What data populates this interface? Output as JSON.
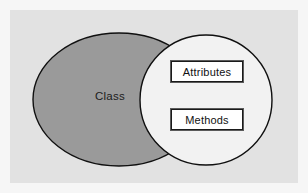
{
  "diagram": {
    "canvas": {
      "width": 308,
      "height": 193,
      "background_color": "#f6f6f6",
      "frame_color": "#e2e2e2"
    },
    "shapes": {
      "class_ellipse": {
        "label": "Class",
        "shape": "ellipse",
        "fill_color": "#9a9a9a",
        "stroke_color": "#101010",
        "cx": 119,
        "cy": 99.5,
        "rx": 86,
        "ry": 66.5
      },
      "compartment_ellipse": {
        "label": "",
        "shape": "ellipse",
        "fill_color": "#f2f2f2",
        "stroke_color": "#101010",
        "cx": 206,
        "cy": 100,
        "rx": 66,
        "ry": 65
      }
    },
    "boxes": [
      {
        "name": "attributes",
        "label": "Attributes",
        "fill_color": "#ffffff",
        "stroke_color": "#1a1a1a"
      },
      {
        "name": "methods",
        "label": "Methods",
        "fill_color": "#ffffff",
        "stroke_color": "#1a1a1a"
      }
    ]
  }
}
